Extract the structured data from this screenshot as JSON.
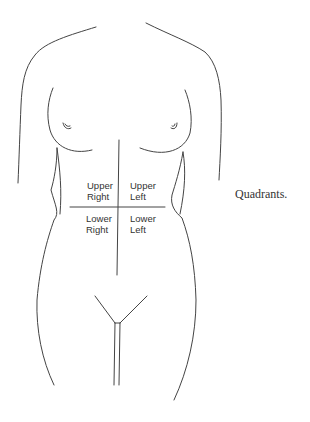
{
  "figure": {
    "caption": "Quadrants.",
    "stroke_color": "#444444",
    "quadrants": {
      "upper_right": "Upper\nRight",
      "upper_left": "Upper\nLeft",
      "lower_right": "Lower\nRight",
      "lower_left": "Lower\nLeft"
    }
  }
}
